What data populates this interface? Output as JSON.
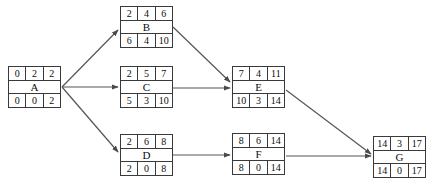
{
  "diagram": {
    "type": "activity-on-node network diagram",
    "nodes": [
      {
        "id": "A",
        "label": "A",
        "top": [
          "0",
          "2",
          "2"
        ],
        "bottom": [
          "0",
          "0",
          "2"
        ],
        "x": 8,
        "y": 66
      },
      {
        "id": "B",
        "label": "B",
        "top": [
          "2",
          "4",
          "6"
        ],
        "bottom": [
          "6",
          "4",
          "10"
        ],
        "x": 120,
        "y": 6
      },
      {
        "id": "C",
        "label": "C",
        "top": [
          "2",
          "5",
          "7"
        ],
        "bottom": [
          "5",
          "3",
          "10"
        ],
        "x": 120,
        "y": 66
      },
      {
        "id": "D",
        "label": "D",
        "top": [
          "2",
          "6",
          "8"
        ],
        "bottom": [
          "2",
          "0",
          "8"
        ],
        "x": 120,
        "y": 134
      },
      {
        "id": "E",
        "label": "E",
        "top": [
          "7",
          "4",
          "11"
        ],
        "bottom": [
          "10",
          "3",
          "14"
        ],
        "x": 232,
        "y": 66
      },
      {
        "id": "F",
        "label": "F",
        "top": [
          "8",
          "6",
          "14"
        ],
        "bottom": [
          "8",
          "0",
          "14"
        ],
        "x": 232,
        "y": 133
      },
      {
        "id": "G",
        "label": "G",
        "top": [
          "14",
          "3",
          "17"
        ],
        "bottom": [
          "14",
          "0",
          "17"
        ],
        "x": 373,
        "y": 136
      }
    ],
    "edges": [
      {
        "from": "A",
        "to": "B",
        "x1": 62,
        "y1": 87,
        "x2": 118,
        "y2": 30
      },
      {
        "from": "A",
        "to": "C",
        "x1": 62,
        "y1": 87,
        "x2": 118,
        "y2": 87
      },
      {
        "from": "A",
        "to": "D",
        "x1": 62,
        "y1": 87,
        "x2": 118,
        "y2": 152
      },
      {
        "from": "B",
        "to": "E",
        "x1": 173,
        "y1": 27,
        "x2": 230,
        "y2": 82
      },
      {
        "from": "C",
        "to": "E",
        "x1": 173,
        "y1": 88,
        "x2": 230,
        "y2": 88
      },
      {
        "from": "D",
        "to": "F",
        "x1": 173,
        "y1": 155,
        "x2": 230,
        "y2": 155
      },
      {
        "from": "E",
        "to": "G",
        "x1": 286,
        "y1": 90,
        "x2": 371,
        "y2": 154
      },
      {
        "from": "F",
        "to": "G",
        "x1": 286,
        "y1": 156,
        "x2": 371,
        "y2": 156
      }
    ],
    "colors": {
      "stroke": "#3a3a3a",
      "edge": "#555555",
      "text": "#0d0d0d",
      "background": "#ffffff"
    }
  }
}
